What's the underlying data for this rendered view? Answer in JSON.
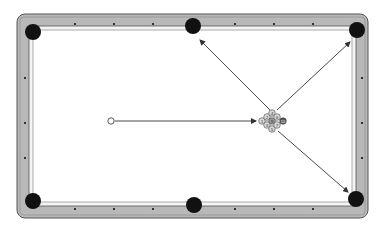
{
  "diagram": {
    "type": "pool-table-break-diagram",
    "colors": {
      "rail": "#b8b8b8",
      "rail_edge": "#555555",
      "cloth": "#ffffff",
      "pocket": "#111111",
      "diamond": "#111111",
      "line": "#333333",
      "ball_stroke": "#444444",
      "ball_fill": "#d9d9d9"
    },
    "table": {
      "x": 17,
      "y": 14,
      "width": 351,
      "height": 204,
      "corner_radius": 8
    },
    "pockets": [
      {
        "id": "top-left",
        "cx": 33,
        "cy": 32,
        "r": 8
      },
      {
        "id": "top-side",
        "cx": 193,
        "cy": 26,
        "r": 8
      },
      {
        "id": "top-right",
        "cx": 357,
        "cy": 30,
        "r": 8
      },
      {
        "id": "bottom-left",
        "cx": 33,
        "cy": 201,
        "r": 8
      },
      {
        "id": "bottom-side",
        "cx": 194,
        "cy": 205,
        "r": 8
      },
      {
        "id": "bottom-right",
        "cx": 356,
        "cy": 199,
        "r": 8
      }
    ],
    "diamonds": {
      "top": [
        75,
        114,
        153,
        235,
        274,
        313
      ],
      "bottom": [
        75,
        114,
        153,
        235,
        274,
        313
      ],
      "left": [
        78,
        123,
        158
      ],
      "right": [
        78,
        123,
        158
      ]
    },
    "cue_ball": {
      "cx": 111,
      "cy": 121,
      "r": 3.2
    },
    "cue_path": {
      "from": [
        115,
        121
      ],
      "to": [
        256,
        121
      ]
    },
    "rack": {
      "type": "9-ball diamond",
      "balls": [
        {
          "label": "1",
          "cx": 262,
          "cy": 121
        },
        {
          "label": "2",
          "cx": 267,
          "cy": 117
        },
        {
          "label": "3",
          "cx": 267,
          "cy": 125
        },
        {
          "label": "4",
          "cx": 272,
          "cy": 113
        },
        {
          "label": "9",
          "cx": 272,
          "cy": 121
        },
        {
          "label": "5",
          "cx": 272,
          "cy": 129
        },
        {
          "label": "6",
          "cx": 277,
          "cy": 117
        },
        {
          "label": "7",
          "cx": 277,
          "cy": 125
        },
        {
          "label": "10",
          "cx": 283,
          "cy": 121
        }
      ],
      "ball_radius": 3.3
    },
    "arrows": [
      {
        "id": "to-top-side-pocket",
        "from": [
          270,
          110
        ],
        "to": [
          200,
          40
        ]
      },
      {
        "id": "to-top-right-pocket",
        "from": [
          277,
          110
        ],
        "to": [
          350,
          42
        ]
      },
      {
        "id": "to-bottom-right-pocket",
        "from": [
          278,
          131
        ],
        "to": [
          348,
          192
        ]
      }
    ]
  }
}
